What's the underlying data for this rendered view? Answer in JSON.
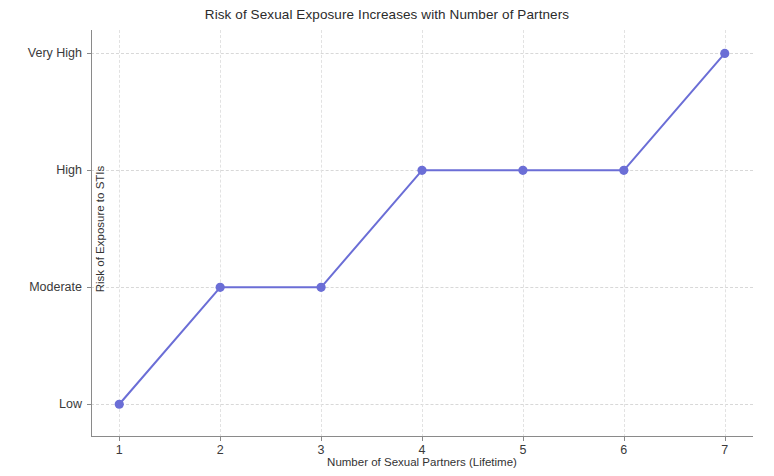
{
  "chart_data": {
    "type": "line",
    "title": "Risk of Sexual Exposure Increases with Number of Partners",
    "xlabel": "Number of Sexual Partners (Lifetime)",
    "ylabel": "Risk of Exposure to STIs",
    "x": [
      1,
      2,
      3,
      4,
      5,
      6,
      7
    ],
    "xtick_labels": [
      "1",
      "2",
      "3",
      "4",
      "5",
      "6",
      "7"
    ],
    "values": [
      "Low",
      "Moderate",
      "Moderate",
      "High",
      "High",
      "High",
      "Very High"
    ],
    "y_numeric": [
      0,
      1,
      1,
      2,
      2,
      2,
      3
    ],
    "ytick_labels": [
      "Low",
      "Moderate",
      "High",
      "Very High"
    ],
    "ytick_values": [
      0,
      1,
      2,
      3
    ],
    "ylim": [
      -0.28,
      3.2
    ],
    "xlim": [
      0.72,
      7.28
    ],
    "grid": true,
    "legend": null,
    "series": [
      {
        "name": "Risk of Exposure to STIs",
        "color": "#6b6ed6",
        "marker": "circle",
        "linewidth": 2,
        "points": [
          {
            "x": 1,
            "y": 0,
            "label": "Low"
          },
          {
            "x": 2,
            "y": 1,
            "label": "Moderate"
          },
          {
            "x": 3,
            "y": 1,
            "label": "Moderate"
          },
          {
            "x": 4,
            "y": 2,
            "label": "High"
          },
          {
            "x": 5,
            "y": 2,
            "label": "High"
          },
          {
            "x": 6,
            "y": 2,
            "label": "High"
          },
          {
            "x": 7,
            "y": 3,
            "label": "Very High"
          }
        ]
      }
    ],
    "colors": {
      "line": "#6b6ed6",
      "marker": "#6b6ed6",
      "grid": "#d8d8d8",
      "axis": "#8a8a8a",
      "text": "#2b2b2b",
      "background": "#ffffff"
    }
  }
}
